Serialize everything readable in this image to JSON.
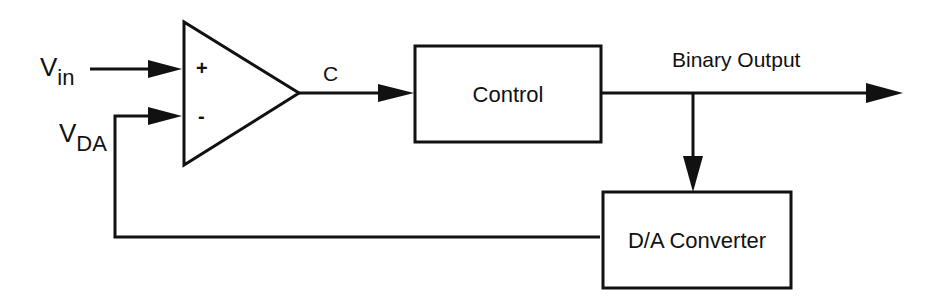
{
  "diagram": {
    "inputs": {
      "vin": {
        "main": "V",
        "sub": "in"
      },
      "vda": {
        "main": "V",
        "sub": "DA"
      }
    },
    "comparator": {
      "plus": "+",
      "minus": "-"
    },
    "signals": {
      "c": "C",
      "binary_output": "Binary Output"
    },
    "blocks": {
      "control": "Control",
      "dac": "D/A Converter"
    }
  }
}
